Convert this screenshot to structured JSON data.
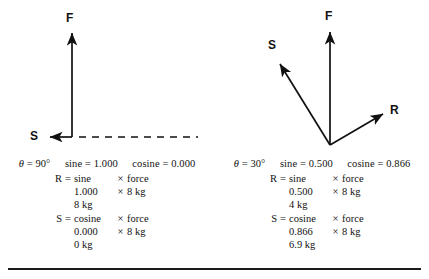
{
  "figure": {
    "panels": [
      {
        "id": "panel-90",
        "vectors": {
          "f_label": "F",
          "s_label": "S",
          "r_label": ""
        },
        "theta_row": {
          "theta_symbol": "θ",
          "theta_eq": "=",
          "theta_value": "90°",
          "sine_label": "sine",
          "sine_eq": "=",
          "sine_value": "1.000",
          "cosine_label": "cosine",
          "cosine_eq": "=",
          "cosine_value": "0.000"
        },
        "calc": [
          {
            "lhs": "R",
            "eq": "=",
            "a": "sine",
            "x": "×",
            "b": "force"
          },
          {
            "lhs": "",
            "eq": "",
            "a": "1.000",
            "x": "×",
            "b": "8 kg"
          },
          {
            "lhs": "",
            "eq": "",
            "a": "8 kg",
            "x": "",
            "b": ""
          },
          {
            "lhs": "S",
            "eq": "=",
            "a": "cosine",
            "x": "×",
            "b": "force"
          },
          {
            "lhs": "",
            "eq": "",
            "a": "0.000",
            "x": "×",
            "b": "8 kg"
          },
          {
            "lhs": "",
            "eq": "",
            "a": "0 kg",
            "x": "",
            "b": ""
          }
        ]
      },
      {
        "id": "panel-30",
        "vectors": {
          "f_label": "F",
          "s_label": "S",
          "r_label": "R"
        },
        "theta_row": {
          "theta_symbol": "θ",
          "theta_eq": "=",
          "theta_value": "30°",
          "sine_label": "sine",
          "sine_eq": "=",
          "sine_value": "0.500",
          "cosine_label": "cosine",
          "cosine_eq": "=",
          "cosine_value": "0.866"
        },
        "calc": [
          {
            "lhs": "R",
            "eq": "=",
            "a": "sine",
            "x": "×",
            "b": "force"
          },
          {
            "lhs": "",
            "eq": "",
            "a": "0.500",
            "x": "×",
            "b": "8 kg"
          },
          {
            "lhs": "",
            "eq": "",
            "a": "4 kg",
            "x": "",
            "b": ""
          },
          {
            "lhs": "S",
            "eq": "=",
            "a": "cosine",
            "x": "×",
            "b": "force"
          },
          {
            "lhs": "",
            "eq": "",
            "a": "0.866",
            "x": "×",
            "b": "8 kg"
          },
          {
            "lhs": "",
            "eq": "",
            "a": "6.9 kg",
            "x": "",
            "b": ""
          }
        ]
      }
    ]
  },
  "colors": {
    "ink": "#111111",
    "rule": "#1a1a1a"
  }
}
